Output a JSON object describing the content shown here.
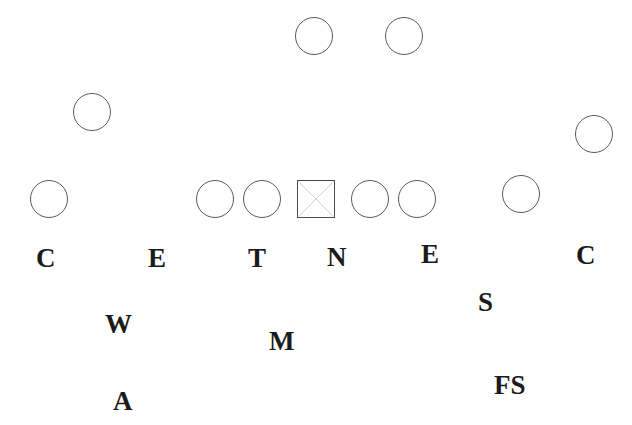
{
  "diagram": {
    "kind": "american-football-formation",
    "canvas": {
      "width": 632,
      "height": 425,
      "background": "#ffffff"
    },
    "ink_color": "#1b1b1b",
    "marker_stroke_color": "#5a5a5a"
  },
  "offense_markers": {
    "description": "Offensive players drawn as open circles; the ball carrier/center drawn as a square with an X through it.",
    "circles": [
      {
        "name": "receiver-left-slot",
        "label": "",
        "x": 295,
        "y": 17,
        "size": 38
      },
      {
        "name": "receiver-right-slot",
        "label": "",
        "x": 385,
        "y": 17,
        "size": 38
      },
      {
        "name": "receiver-wide-left",
        "label": "",
        "x": 73,
        "y": 93,
        "size": 38
      },
      {
        "name": "receiver-wide-right",
        "label": "",
        "x": 575,
        "y": 115,
        "size": 38
      },
      {
        "name": "lineman-far-left",
        "label": "",
        "x": 30,
        "y": 180,
        "size": 38
      },
      {
        "name": "lineman-left-tackle",
        "label": "",
        "x": 196,
        "y": 180,
        "size": 38
      },
      {
        "name": "lineman-left-guard",
        "label": "",
        "x": 243,
        "y": 180,
        "size": 38
      },
      {
        "name": "lineman-right-guard",
        "label": "",
        "x": 351,
        "y": 180,
        "size": 38
      },
      {
        "name": "lineman-right-tackle",
        "label": "",
        "x": 398,
        "y": 180,
        "size": 38
      },
      {
        "name": "lineman-far-right",
        "label": "",
        "x": 502,
        "y": 175,
        "size": 38
      }
    ],
    "square": {
      "name": "center-with-ball",
      "label": "",
      "x": 297,
      "y": 180,
      "size": 38,
      "glyph": "square-with-x"
    }
  },
  "defense_labels": [
    {
      "name": "corner-left",
      "label": "C",
      "x": 36,
      "y": 245,
      "size": 27
    },
    {
      "name": "end-left",
      "label": "E",
      "x": 148,
      "y": 245,
      "size": 27
    },
    {
      "name": "tackle",
      "label": "T",
      "x": 248,
      "y": 245,
      "size": 27
    },
    {
      "name": "nose",
      "label": "N",
      "x": 327,
      "y": 244,
      "size": 27
    },
    {
      "name": "end-right",
      "label": "E",
      "x": 421,
      "y": 241,
      "size": 27
    },
    {
      "name": "corner-right",
      "label": "C",
      "x": 576,
      "y": 242,
      "size": 27
    },
    {
      "name": "strong-safety",
      "label": "S",
      "x": 478,
      "y": 289,
      "size": 27
    },
    {
      "name": "will-linebacker",
      "label": "W",
      "x": 105,
      "y": 311,
      "size": 27
    },
    {
      "name": "mike-linebacker",
      "label": "M",
      "x": 269,
      "y": 328,
      "size": 27
    },
    {
      "name": "free-safety",
      "label": "FS",
      "x": 494,
      "y": 372,
      "size": 27
    },
    {
      "name": "rover-safety",
      "label": "A",
      "x": 113,
      "y": 388,
      "size": 27
    }
  ]
}
